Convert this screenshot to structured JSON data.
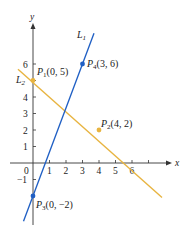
{
  "diagram": {
    "axes": {
      "x_label": "x",
      "y_label": "y",
      "origin_label": "0",
      "x_ticks": [
        "1",
        "2",
        "3",
        "4",
        "5",
        "6"
      ],
      "y_ticks": [
        "1",
        "2",
        "3",
        "4",
        "5",
        "6"
      ],
      "y_tick_labels_shown": [
        "6",
        "4",
        "3",
        "2",
        "1",
        "−1"
      ]
    },
    "lines": [
      {
        "name": "L",
        "sub": "1",
        "color": "#1f5fc4",
        "through": [
          "P3(0, −2)",
          "P4(3, 6)"
        ]
      },
      {
        "name": "L",
        "sub": "2",
        "color": "#e8b440",
        "through": [
          "P1(0, 5)",
          "P2(4, 2)"
        ]
      }
    ],
    "points": [
      {
        "name": "P",
        "sub": "1",
        "coords": "(0, 5)",
        "line": "L2"
      },
      {
        "name": "P",
        "sub": "2",
        "coords": "(4, 2)",
        "line": "L2"
      },
      {
        "name": "P",
        "sub": "3",
        "coords": "(0, −2)",
        "line": "L1"
      },
      {
        "name": "P",
        "sub": "4",
        "coords": "(3, 6)",
        "line": "L1"
      }
    ],
    "colors": {
      "axis": "#333333",
      "line1": "#1f5fc4",
      "line2": "#e8b440"
    }
  }
}
